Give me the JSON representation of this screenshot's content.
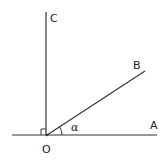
{
  "diagram": {
    "type": "geometry-angle",
    "stroke_color": "#333333",
    "points": {
      "O": {
        "label": "O",
        "x": 47,
        "y": 135
      },
      "A": {
        "label": "A",
        "x": 157,
        "y": 135
      },
      "B": {
        "label": "B",
        "x": 145,
        "y": 71
      },
      "C": {
        "label": "C",
        "x": 46,
        "y": 12
      }
    },
    "labels": {
      "O": "O",
      "A": "A",
      "B": "B",
      "C": "C",
      "angle": "α"
    },
    "annotations": {
      "right_angle": "angle AOC is a right angle (square marker at O)",
      "angle_alpha": "α is angle AOB"
    }
  }
}
